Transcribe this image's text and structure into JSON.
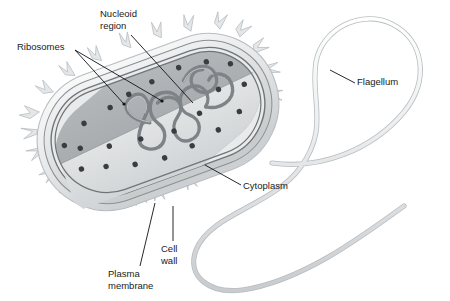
{
  "figure": {
    "type": "labeled biological diagram",
    "background_color": "#ffffff",
    "label_color": "#1a1a1a",
    "leader_line_color": "#111111"
  },
  "labels": {
    "ribosomes": "Ribosomes",
    "nucleoid": "Nucleoid\nregion",
    "flagellum": "Flagellum",
    "cytoplasm": "Cytoplasm",
    "cell_wall": "Cell\nwall",
    "plasma_membrane": "Plasma\nmembrane"
  },
  "structures": {
    "cell_body": {
      "name": "rod-shaped bacterial cell",
      "shape": "capsule",
      "rotation_deg": -20,
      "outer_capsule_color": "#eceeef",
      "cell_wall_color": "#d7dadc",
      "interior_back_wall_color": "#a9adb0",
      "interior_floor_color": "#dcdee0",
      "envelope_line_color": "#6f7477"
    },
    "pili": {
      "name": "pili / fimbriae spikes",
      "count": 26,
      "color": "#e2e5e6"
    },
    "nucleoid_dna": {
      "name": "circular DNA strand loops",
      "color": "#7e8387"
    },
    "ribosomes": {
      "name": "ribosome granules",
      "count": 22,
      "color": "#3a3d40"
    },
    "flagellum": {
      "name": "flagellum tail",
      "color": "#e8eaeb",
      "outline": "#9b9fa2"
    }
  }
}
